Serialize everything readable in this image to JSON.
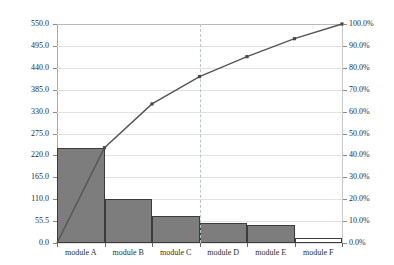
{
  "chart_data": {
    "type": "bar",
    "title": "",
    "subtitle": "",
    "xlabel": "",
    "ylabel": "",
    "categories": [
      "module A",
      "module B",
      "module C",
      "module D",
      "module E",
      "module F"
    ],
    "values": [
      239,
      110,
      69,
      50,
      45,
      12
    ],
    "series": [
      {
        "name": "count",
        "type": "bar",
        "values": [
          239,
          110,
          69,
          50,
          45,
          12
        ]
      },
      {
        "name": "cumulative percent",
        "type": "line",
        "values": [
          43.5,
          63.5,
          76.0,
          85.1,
          93.3,
          100.0
        ]
      }
    ],
    "cumulative_percent": [
      43.5,
      63.5,
      76.0,
      85.1,
      93.3,
      100.0
    ],
    "ylim": [
      0,
      550
    ],
    "ylim_secondary": [
      0,
      100
    ],
    "y_ticks_left": [
      "0.0",
      "55.5",
      "110.0",
      "165.0",
      "220.0",
      "275.0",
      "330.0",
      "385.0",
      "440.0",
      "495.0",
      "550.0"
    ],
    "y_tick_values_left": [
      0,
      55,
      110,
      165,
      220,
      275,
      330,
      385,
      440,
      495,
      550
    ],
    "y_ticks_right": [
      "0.0%",
      "10.0%",
      "20.0%",
      "30.0%",
      "40.0%",
      "50.0%",
      "60.0%",
      "70.0%",
      "80.0%",
      "90.0%",
      "100.0%"
    ],
    "y_tick_values_right": [
      0,
      10,
      20,
      30,
      40,
      50,
      60,
      70,
      80,
      90,
      100
    ],
    "grid": true,
    "legend": "none",
    "reference_line": {
      "category_index": 2,
      "label": ""
    },
    "colors": {
      "bar_fill": "#7d7d7d",
      "bar_border": "#3b3b3b",
      "line": "#555555",
      "grid": "#e2e2e2",
      "axis": "#4a4a4a",
      "reference_line": "#b7c9b7",
      "background": "#ffffff",
      "text": "#2c2c2c"
    }
  }
}
